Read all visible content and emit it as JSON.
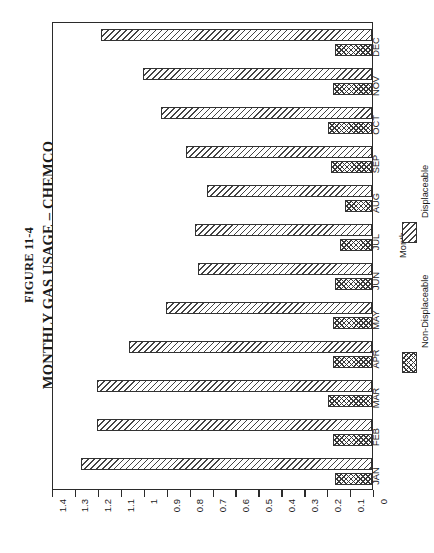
{
  "figure": {
    "number": "FIGURE 11-4",
    "title": "MONTHLY GAS USAGE – CHEMCO"
  },
  "axes": {
    "category_axis_label": "Month",
    "value_axis_ticks": [
      "1.4",
      "1.3",
      "1.2",
      "1.1",
      "1",
      "0.9",
      "0.8",
      "0.7",
      "0.6",
      "0.5",
      "0.4",
      "0.3",
      "0.2",
      "0.1",
      "0"
    ]
  },
  "legend": {
    "items": [
      {
        "label": "Non-Displaceable",
        "pattern": "cross-hatch",
        "color": "#3a3a3a"
      },
      {
        "label": "Displaceable",
        "pattern": "diagonal-hatch",
        "color": "#444444"
      }
    ]
  },
  "chart_data": {
    "type": "bar",
    "orientation": "horizontal",
    "title": "MONTHLY GAS USAGE – CHEMCO",
    "subtitle": "FIGURE 11-4",
    "xlabel": "Month",
    "ylabel": "",
    "ylim": [
      0,
      1.4
    ],
    "grid": false,
    "legend_position": "right",
    "categories": [
      "JAN",
      "FEB",
      "MAR",
      "APR",
      "MAY",
      "JUN",
      "JUL",
      "AUG",
      "SEP",
      "OCT",
      "NOV",
      "DEC"
    ],
    "series": [
      {
        "name": "Displaceable",
        "pattern": "diagonal-hatch",
        "values": [
          1.27,
          1.2,
          1.2,
          1.06,
          0.9,
          0.76,
          0.77,
          0.72,
          0.81,
          0.92,
          1.0,
          1.18
        ]
      },
      {
        "name": "Non-Displaceable",
        "pattern": "cross-hatch",
        "values": [
          0.16,
          0.17,
          0.19,
          0.17,
          0.17,
          0.16,
          0.14,
          0.12,
          0.18,
          0.19,
          0.17,
          0.16
        ]
      }
    ]
  }
}
